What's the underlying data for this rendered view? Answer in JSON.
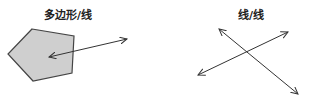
{
  "panels": [
    {
      "title": "多边形/线",
      "shapes": [
        "polygon",
        "double-arrow-line"
      ]
    },
    {
      "title": "线/线",
      "shapes": [
        "double-arrow-line",
        "double-arrow-line"
      ]
    }
  ],
  "colors": {
    "polygon_fill": "#cfcfcf",
    "stroke": "#333333"
  }
}
